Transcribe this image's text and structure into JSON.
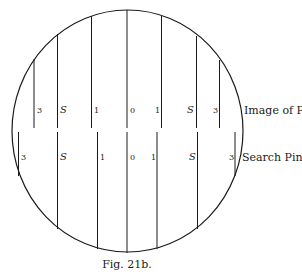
{
  "figure": {
    "caption": "Fig. 21b.",
    "row_labels": {
      "top": "Image of P",
      "top_subscript": "0",
      "bottom": "Search Pin"
    },
    "top_scale": {
      "name": "Image of P0",
      "ticks": [
        "3",
        "S",
        "1",
        "0",
        "1",
        "S",
        "3"
      ]
    },
    "bottom_scale": {
      "name": "Search Pin",
      "ticks": [
        "3",
        "S",
        "1",
        "0",
        "1",
        "S",
        "3"
      ]
    },
    "colors": {
      "stroke": "#1a1a1a",
      "background": "#ffffff"
    }
  }
}
